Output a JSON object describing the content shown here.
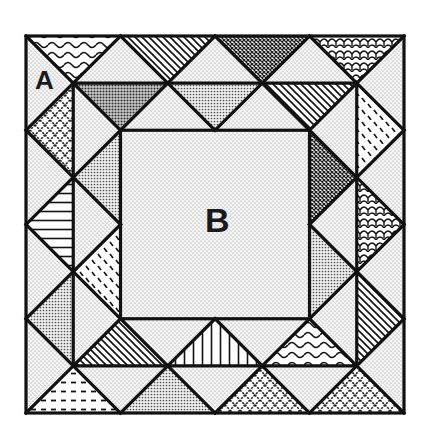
{
  "diagram": {
    "type": "quilt-block",
    "labels": {
      "corner": "A",
      "center": "B"
    },
    "grid_units": 8,
    "colors": {
      "line": "#111111",
      "background": "#ffffff",
      "light_fill": "#f2f2f2",
      "medium_fill": "#cfcfcf",
      "dark_fill": "#9a9a9a"
    },
    "border_patterns": {
      "top_outer": [
        "waves",
        "diagonal-stripes",
        "dense-crosshatch",
        "scales"
      ],
      "top_inner": [
        "dark-dots",
        "medium-dots",
        "diagonal-stripes"
      ],
      "left_outer": [
        "crosshatch",
        "horizontal-stripes",
        "medium-dots"
      ],
      "left_inner": [
        "medium-dots",
        "dashes"
      ],
      "right_outer": [
        "dashes",
        "scales",
        "diagonal-stripes"
      ],
      "right_inner": [
        "dense-crosshatch",
        "medium-dots"
      ],
      "bottom_inner": [
        "diagonal-stripes",
        "vertical-stripes",
        "waves"
      ],
      "bottom_outer": [
        "dashed-lines",
        "medium-dots",
        "crosshatch",
        "crosshatch"
      ]
    }
  }
}
